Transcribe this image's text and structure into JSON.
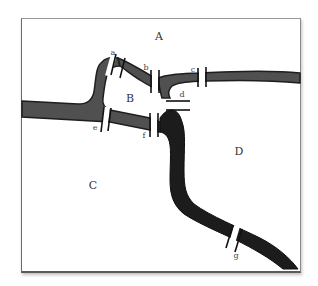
{
  "diagram": {
    "regions": [
      {
        "id": "A",
        "label": "A",
        "x": 159,
        "y": 36
      },
      {
        "id": "B",
        "label": "B",
        "x": 130,
        "y": 98
      },
      {
        "id": "C",
        "label": "C",
        "x": 93,
        "y": 185
      },
      {
        "id": "D",
        "label": "D",
        "x": 239,
        "y": 151
      }
    ],
    "bridges": [
      {
        "id": "a",
        "label": "a",
        "x": 113,
        "y": 53
      },
      {
        "id": "b",
        "label": "b",
        "x": 146,
        "y": 68
      },
      {
        "id": "c",
        "label": "c",
        "x": 193,
        "y": 70
      },
      {
        "id": "d",
        "label": "d",
        "x": 182,
        "y": 95
      },
      {
        "id": "e",
        "label": "e",
        "x": 95,
        "y": 128
      },
      {
        "id": "f",
        "label": "f",
        "x": 144,
        "y": 136
      },
      {
        "id": "g",
        "label": "g",
        "x": 236,
        "y": 256
      }
    ],
    "colors": {
      "river_light": "#5c5c5c",
      "river_dark": "#1a1a1a",
      "bridge": "#111111",
      "frame": "#6a6a6a"
    }
  }
}
